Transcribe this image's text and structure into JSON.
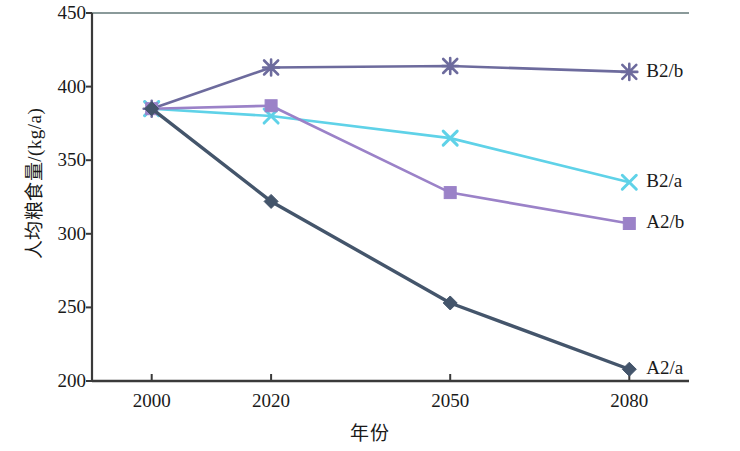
{
  "chart_data": {
    "type": "line",
    "title": "",
    "xlabel": "年份",
    "ylabel": "人均粮食量/(kg/a)",
    "categories": [
      "2000",
      "2020",
      "2050",
      "2080"
    ],
    "x_positions": [
      2000,
      2020,
      2050,
      2080
    ],
    "xlim": [
      1990,
      2090
    ],
    "ylim": [
      200,
      450
    ],
    "ytick_labels": [
      "200",
      "250",
      "300",
      "350",
      "400",
      "450"
    ],
    "ytick_values": [
      200,
      250,
      300,
      350,
      400,
      450
    ],
    "grid": false,
    "legend_position": "inline-right-of-line-ends",
    "series": [
      {
        "name": "B2/b",
        "values": [
          385,
          413,
          414,
          410
        ],
        "color": "#6d6b9d",
        "marker": "star"
      },
      {
        "name": "B2/a",
        "values": [
          385,
          380,
          365,
          335
        ],
        "color": "#5fd2e8",
        "marker": "x"
      },
      {
        "name": "A2/b",
        "values": [
          385,
          387,
          328,
          307
        ],
        "color": "#9b82c8",
        "marker": "square"
      },
      {
        "name": "A2/a",
        "values": [
          385,
          322,
          253,
          208
        ],
        "color": "#44556b",
        "marker": "diamond"
      }
    ]
  },
  "axis": {
    "frame_color": "#3a3a3a",
    "top_border_color": "#8a9a9a"
  }
}
